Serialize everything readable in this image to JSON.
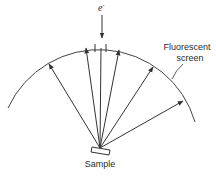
{
  "diagram": {
    "incident_beam_label": "e",
    "incident_beam_superscript": "-",
    "screen_label_line1": "Fluorescent",
    "screen_label_line2": "screen",
    "sample_label": "Sample",
    "colors": {
      "line": "#333333",
      "background": "#ffffff"
    },
    "diffracted_beams": 5
  }
}
